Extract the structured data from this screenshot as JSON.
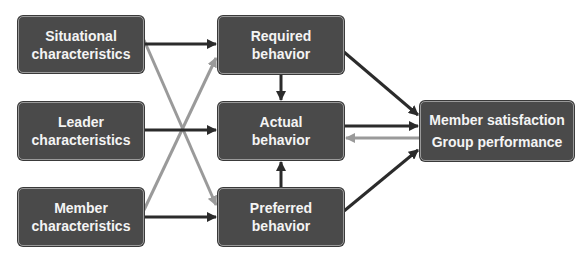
{
  "diagram": {
    "colors": {
      "box_fill": "#4a4a4a",
      "box_border": "#9a9a9a",
      "box_text": "#f4f4f4",
      "arrow_primary": "#2b2b2b",
      "arrow_secondary": "#9a9a9a"
    },
    "nodes": {
      "situational": {
        "line1": "Situational",
        "line2": "characteristics"
      },
      "leader": {
        "line1": "Leader",
        "line2": "characteristics"
      },
      "member": {
        "line1": "Member",
        "line2": "characteristics"
      },
      "required": {
        "line1": "Required",
        "line2": "behavior"
      },
      "actual": {
        "line1": "Actual",
        "line2": "behavior"
      },
      "preferred": {
        "line1": "Preferred",
        "line2": "behavior"
      },
      "outcome": {
        "line1": "Member satisfaction",
        "line2": "Group performance"
      }
    },
    "edges": [
      {
        "from": "situational",
        "to": "required",
        "style": "primary"
      },
      {
        "from": "situational",
        "to": "preferred",
        "style": "secondary"
      },
      {
        "from": "leader",
        "to": "actual",
        "style": "primary"
      },
      {
        "from": "member",
        "to": "preferred",
        "style": "primary"
      },
      {
        "from": "member",
        "to": "required",
        "style": "secondary"
      },
      {
        "from": "required",
        "to": "actual",
        "style": "primary"
      },
      {
        "from": "preferred",
        "to": "actual",
        "style": "primary"
      },
      {
        "from": "required",
        "to": "outcome",
        "style": "primary"
      },
      {
        "from": "actual",
        "to": "outcome",
        "style": "primary"
      },
      {
        "from": "outcome",
        "to": "actual",
        "style": "secondary"
      },
      {
        "from": "preferred",
        "to": "outcome",
        "style": "primary"
      }
    ]
  }
}
